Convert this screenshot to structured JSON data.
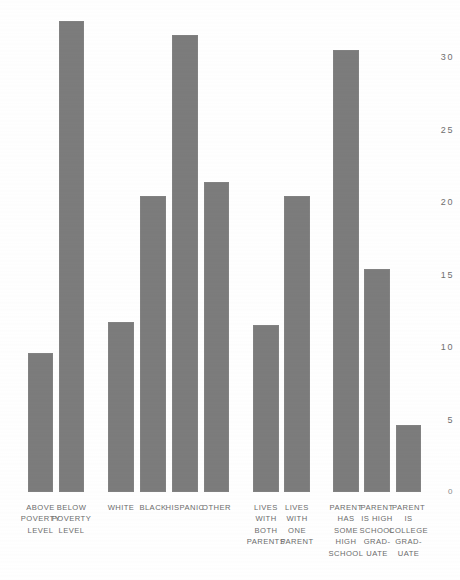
{
  "chart_data": {
    "type": "bar",
    "title": "",
    "xlabel": "",
    "ylabel": "",
    "ylim": [
      0,
      34
    ],
    "grid": false,
    "legend": null,
    "yticks": [
      0,
      5,
      10,
      15,
      20,
      25,
      30
    ],
    "ytick_labels": [
      "0",
      "5",
      "10",
      "15",
      "20",
      "25",
      "30"
    ],
    "categories": [
      "ABOVE\nPOVERTY\nLEVEL",
      "BELOW\nPOVERTY\nLEVEL",
      "WHITE",
      "BLACK",
      "HISPANIC",
      "OTHER",
      "LIVES\nWITH\nBOTH\nPARENTS",
      "LIVES\nWITH\nONE\nPARENT",
      "PARENT\nHAS\nSOME\nHIGH\nSCHOOL",
      "PARENT\nIS HIGH\nSCHOOL\nGRAD-\nUATE",
      "PARENT\nIS\nCOLLEGE\nGRAD-\nUATE"
    ],
    "values": [
      9.6,
      32.5,
      11.7,
      20.4,
      31.5,
      21.4,
      11.5,
      20.4,
      30.5,
      15.4,
      4.6
    ],
    "groups": [
      {
        "name": "poverty-status",
        "indices": [
          0,
          1
        ]
      },
      {
        "name": "race-ethnicity",
        "indices": [
          2,
          3,
          4,
          5
        ]
      },
      {
        "name": "family-structure",
        "indices": [
          6,
          7
        ]
      },
      {
        "name": "parent-education",
        "indices": [
          8,
          9,
          10
        ]
      }
    ],
    "bar_color": "#7c7c7c",
    "background_color": "#ffffff"
  },
  "bars": [
    {
      "label": "ABOVE\nPOVERTY\nLEVEL",
      "value": 9.6,
      "x": 28,
      "w": 25
    },
    {
      "label": "BELOW\nPOVERTY\nLEVEL",
      "value": 32.5,
      "x": 59,
      "w": 25
    },
    {
      "label": "WHITE",
      "value": 11.7,
      "x": 108,
      "w": 26
    },
    {
      "label": "BLACK",
      "value": 20.4,
      "x": 140,
      "w": 26
    },
    {
      "label": "HISPANIC",
      "value": 31.5,
      "x": 172,
      "w": 26
    },
    {
      "label": "OTHER",
      "value": 21.4,
      "x": 204,
      "w": 25
    },
    {
      "label": "LIVES\nWITH\nBOTH\nPARENTS",
      "value": 11.5,
      "x": 253,
      "w": 26
    },
    {
      "label": "LIVES\nWITH\nONE\nPARENT",
      "value": 20.4,
      "x": 284,
      "w": 26
    },
    {
      "label": "PARENT\nHAS\nSOME\nHIGH\nSCHOOL",
      "value": 30.5,
      "x": 333,
      "w": 26
    },
    {
      "label": "PARENT\nIS HIGH\nSCHOOL\nGRAD-\nUATE",
      "value": 15.4,
      "x": 364,
      "w": 26
    },
    {
      "label": "PARENT\nIS\nCOLLEGE\nGRAD-\nUATE",
      "value": 4.6,
      "x": 396,
      "w": 25
    }
  ],
  "axis": {
    "baseline_y": 492,
    "unit_px": 14.5,
    "tick_x_right": 454
  }
}
